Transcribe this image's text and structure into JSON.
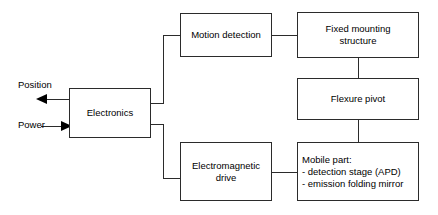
{
  "diagram": {
    "type": "block-diagram",
    "line_color": "#2b2b2b",
    "box_fill": "#ffffff",
    "text_color": "#000000",
    "blocks": [
      {
        "id": "electronics",
        "label": "Electronics",
        "lines": [
          "Electronics"
        ]
      },
      {
        "id": "motion_detection",
        "label": "Motion detection",
        "lines": [
          "Motion detection"
        ]
      },
      {
        "id": "fixed_mounting",
        "label": "Fixed mounting structure",
        "lines": [
          "Fixed mounting",
          "structure"
        ]
      },
      {
        "id": "flexure_pivot",
        "label": "Flexure pivot",
        "lines": [
          "Flexure pivot"
        ]
      },
      {
        "id": "em_drive",
        "label": "Electromagnetic drive",
        "lines": [
          "Electromagnetic",
          "drive"
        ]
      },
      {
        "id": "mobile_part",
        "label": "Mobile part",
        "lines": [
          "Mobile part:",
          "- detection stage (APD)",
          "- emission folding mirror"
        ]
      }
    ],
    "io": {
      "position": {
        "label": "Position",
        "direction": "out"
      },
      "power": {
        "label": "Power",
        "direction": "in"
      }
    },
    "connections": [
      {
        "from": "electronics",
        "to": "motion_detection",
        "arrow": false
      },
      {
        "from": "electronics",
        "to": "em_drive",
        "arrow": false
      },
      {
        "from": "motion_detection",
        "to": "fixed_mounting",
        "arrow": false
      },
      {
        "from": "fixed_mounting",
        "to": "flexure_pivot",
        "arrow": false
      },
      {
        "from": "flexure_pivot",
        "to": "mobile_part",
        "arrow": false
      },
      {
        "from": "em_drive",
        "to": "mobile_part",
        "arrow": false
      },
      {
        "from": "electronics",
        "to": "position",
        "arrow": true
      },
      {
        "from": "power",
        "to": "electronics",
        "arrow": true
      }
    ]
  }
}
